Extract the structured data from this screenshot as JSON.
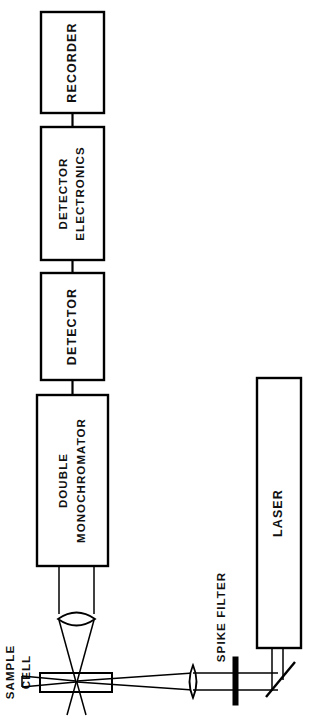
{
  "diagram": {
    "orientation": "labels rotated 90 degrees counter-clockwise",
    "ink_color": "#000000",
    "background_color": "#ffffff",
    "blocks": [
      {
        "id": "recorder",
        "label": "RECORDER"
      },
      {
        "id": "detector-electronics",
        "label_line1": "DETECTOR",
        "label_line2": "ELECTRONICS"
      },
      {
        "id": "detector",
        "label": "DETECTOR"
      },
      {
        "id": "double-monochromator",
        "label_line1": "DOUBLE",
        "label_line2": "MONOCHROMATOR"
      },
      {
        "id": "laser",
        "label": "LASER"
      }
    ],
    "annotations": [
      {
        "id": "sample-cell",
        "label_line1": "SAMPLE",
        "label_line2": "CELL"
      },
      {
        "id": "spike-filter",
        "label": "SPIKE FILTER"
      }
    ],
    "optics": [
      {
        "id": "collection-lens",
        "name": "collection-lens"
      },
      {
        "id": "focusing-lens",
        "name": "focusing-lens"
      },
      {
        "id": "spike-filter-element",
        "name": "spike-filter"
      },
      {
        "id": "turning-mirror",
        "name": "45-degree-mirror"
      },
      {
        "id": "sample-cuvette",
        "name": "sample-cell-cuvette"
      }
    ]
  }
}
